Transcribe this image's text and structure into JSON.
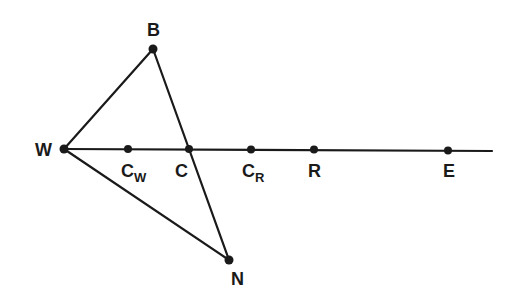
{
  "diagram": {
    "points": {
      "W": {
        "label": "W",
        "sub": "",
        "x": 64,
        "y": 149
      },
      "B": {
        "label": "B",
        "sub": "",
        "x": 153,
        "y": 49
      },
      "N": {
        "label": "N",
        "sub": "",
        "x": 229,
        "y": 260
      },
      "Cw": {
        "label": "C",
        "sub": "W",
        "x": 128,
        "y": 149
      },
      "C": {
        "label": "C",
        "sub": "",
        "x": 189,
        "y": 149
      },
      "CR": {
        "label": "C",
        "sub": "R",
        "x": 251,
        "y": 149
      },
      "R": {
        "label": "R",
        "sub": "",
        "x": 314,
        "y": 149
      },
      "E": {
        "label": "E",
        "sub": "",
        "x": 448,
        "y": 150
      }
    },
    "segments": [
      [
        "W",
        "B"
      ],
      [
        "B",
        "N"
      ],
      [
        "W",
        "N"
      ],
      [
        "W",
        "line_end"
      ]
    ],
    "colors": {
      "ink": "#1a1a1a",
      "background": "#ffffff"
    }
  }
}
